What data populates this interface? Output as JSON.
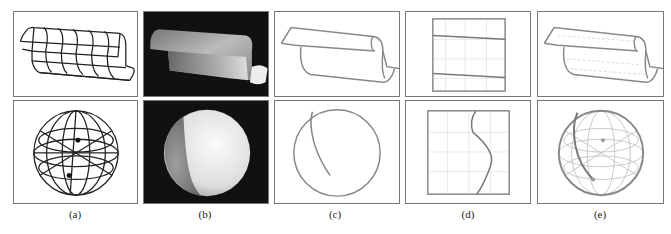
{
  "figure": {
    "columns": [
      {
        "label": "(a)",
        "top": "wireframe-sheet",
        "bottom": "wireframe-sphere"
      },
      {
        "label": "(b)",
        "top": "shaded-sheet",
        "bottom": "shaded-sphere"
      },
      {
        "label": "(c)",
        "top": "outline-sheet",
        "bottom": "circle-with-curve"
      },
      {
        "label": "(d)",
        "top": "grid-box-two-lines",
        "bottom": "grid-box-s-curve"
      },
      {
        "label": "(e)",
        "top": "light-mesh-sheet",
        "bottom": "light-mesh-sphere-with-curve"
      }
    ]
  }
}
